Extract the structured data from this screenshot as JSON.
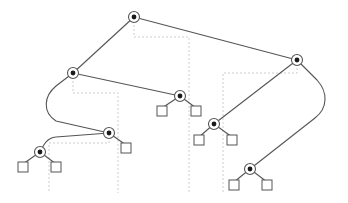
{
  "diagram": {
    "type": "binary-tree",
    "colors": {
      "edge": "#555555",
      "guide": "#c8c8c8",
      "node_dot": "#1a1a1a",
      "background": "#ffffff"
    },
    "internal_nodes": [
      {
        "id": "root",
        "x": 134,
        "y": 17
      },
      {
        "id": "a",
        "x": 73,
        "y": 73
      },
      {
        "id": "b",
        "x": 297,
        "y": 60
      },
      {
        "id": "c",
        "x": 180,
        "y": 96
      },
      {
        "id": "d",
        "x": 109,
        "y": 133
      },
      {
        "id": "e",
        "x": 40,
        "y": 152
      },
      {
        "id": "f",
        "x": 214,
        "y": 124
      },
      {
        "id": "g",
        "x": 250,
        "y": 169
      }
    ],
    "leaves": [
      {
        "parent": "c",
        "x": 162,
        "y": 111
      },
      {
        "parent": "c",
        "x": 196,
        "y": 111
      },
      {
        "parent": "d",
        "x": 126,
        "y": 148
      },
      {
        "parent": "e",
        "x": 23,
        "y": 167
      },
      {
        "parent": "e",
        "x": 56,
        "y": 167
      },
      {
        "parent": "f",
        "x": 199,
        "y": 140
      },
      {
        "parent": "f",
        "x": 232,
        "y": 140
      },
      {
        "parent": "g",
        "x": 234,
        "y": 185
      },
      {
        "parent": "g",
        "x": 267,
        "y": 185
      }
    ],
    "edges": [
      {
        "from": "root",
        "to": "a",
        "d": "M134,17 L73,73"
      },
      {
        "from": "root",
        "to": "b",
        "d": "M134,17 L297,60"
      },
      {
        "from": "a",
        "to": "c",
        "d": "M73,73 L180,96"
      },
      {
        "from": "a",
        "to": "d",
        "d": "M73,73 L56,86 C44,96 42,112 56,121 L109,133"
      },
      {
        "from": "d",
        "to": "e",
        "d": "M109,133 L56,137 C47,138 44,144 40,152"
      },
      {
        "from": "b",
        "to": "f",
        "d": "M297,60 L214,124"
      },
      {
        "from": "b",
        "to": "g",
        "d": "M297,60 L317,80 C328,92 328,108 315,118 L250,169"
      },
      {
        "from": "c",
        "to": "leaf",
        "d": "M180,96 L162,108"
      },
      {
        "from": "c",
        "to": "leaf",
        "d": "M180,96 L196,108"
      },
      {
        "from": "d",
        "to": "leaf",
        "d": "M109,133 L126,145"
      },
      {
        "from": "e",
        "to": "leaf",
        "d": "M40,152 L23,164"
      },
      {
        "from": "e",
        "to": "leaf",
        "d": "M40,152 L56,164"
      },
      {
        "from": "f",
        "to": "leaf",
        "d": "M214,124 L199,137"
      },
      {
        "from": "f",
        "to": "leaf",
        "d": "M214,124 L232,137"
      },
      {
        "from": "g",
        "to": "leaf",
        "d": "M250,169 L234,182"
      },
      {
        "from": "g",
        "to": "leaf",
        "d": "M250,169 L267,182"
      }
    ],
    "guides": [
      {
        "node": "root",
        "d": "M134,21 L134,37 L189,37 L189,193"
      },
      {
        "node": "a",
        "d": "M73,77 L73,93 L118,93 L118,193"
      },
      {
        "node": "b",
        "d": "M297,64 L297,73 L223,73 L223,193"
      },
      {
        "node": "d",
        "d": "M109,137 L109,143 L49,143 L49,193"
      }
    ]
  }
}
